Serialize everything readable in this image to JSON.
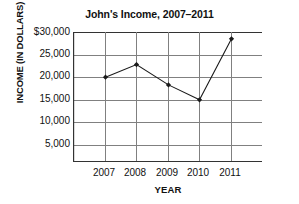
{
  "chart_data": {
    "type": "line",
    "title": "John's Income, 2007–2011",
    "xlabel": "YEAR",
    "ylabel": "INCOME (IN DOLLARS)",
    "categories": [
      "2007",
      "2008",
      "2009",
      "2010",
      "2011"
    ],
    "values": [
      20000,
      22800,
      18300,
      15000,
      28500
    ],
    "series": [
      {
        "name": "Income",
        "values": [
          20000,
          22800,
          18300,
          15000,
          28500
        ]
      }
    ],
    "ytick_labels": [
      "$30,000",
      "25,000",
      "20,000",
      "15,000",
      "10,000",
      "5,000"
    ],
    "ytick_values": [
      30000,
      25000,
      20000,
      15000,
      10000,
      5000
    ],
    "xtick_labels": [
      "2007",
      "2008",
      "2009",
      "2010",
      "2011"
    ],
    "ylim": [
      0,
      30000
    ],
    "grid": "both",
    "legend": "none",
    "marker": "filled-diamond",
    "line_color": "#1a1a1a",
    "grid_color": "#808080",
    "axis_color": "#333333",
    "background_color": "#ffffff"
  }
}
